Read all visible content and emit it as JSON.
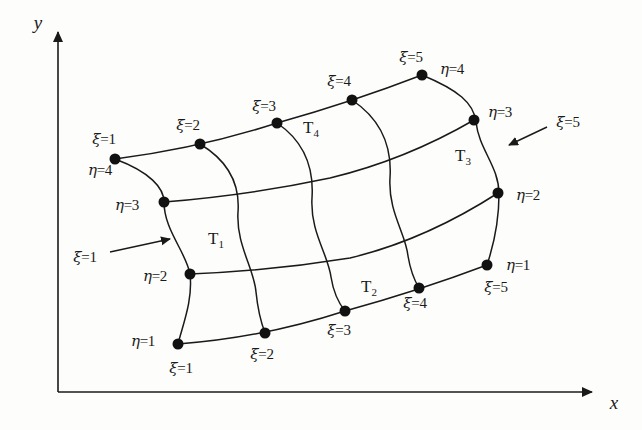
{
  "figure": {
    "background_color": "#fdfdfb",
    "line_color": "#1a1a1a",
    "node_color": "#111111"
  },
  "axes": {
    "x_label": "x",
    "y_label": "y",
    "origin": {
      "x": 58,
      "y": 392
    },
    "x_end": {
      "x": 600,
      "y": 392
    },
    "y_end": {
      "x": 58,
      "y": 25
    }
  },
  "elements": [
    {
      "name": "T",
      "index": "1",
      "x": 216,
      "y": 240
    },
    {
      "name": "T",
      "index": "2",
      "x": 369,
      "y": 288
    },
    {
      "name": "T",
      "index": "3",
      "x": 463,
      "y": 157
    },
    {
      "name": "T",
      "index": "4",
      "x": 311,
      "y": 129
    }
  ],
  "annotations": [
    {
      "text_sym": "ξ",
      "text_val": "=1",
      "label_x": 85,
      "label_y": 257,
      "arrow_from": {
        "x": 110,
        "y": 252
      },
      "arrow_to": {
        "x": 175,
        "y": 238
      }
    },
    {
      "text_sym": "ξ",
      "text_val": "=5",
      "label_x": 568,
      "label_y": 122,
      "arrow_from": {
        "x": 545,
        "y": 128
      },
      "arrow_to": {
        "x": 503,
        "y": 148
      }
    }
  ],
  "node_labels": [
    {
      "sym": "ξ",
      "val": "=1",
      "x": 104,
      "y": 139
    },
    {
      "sym": "ξ",
      "val": "=2",
      "x": 188,
      "y": 125
    },
    {
      "sym": "ξ",
      "val": "=3",
      "x": 264,
      "y": 106
    },
    {
      "sym": "ξ",
      "val": "=4",
      "x": 339,
      "y": 81
    },
    {
      "sym": "ξ",
      "val": "=5",
      "x": 411,
      "y": 57
    },
    {
      "sym": "η",
      "val": "=4",
      "x": 452,
      "y": 69
    },
    {
      "sym": "η",
      "val": "=3",
      "x": 500,
      "y": 112
    },
    {
      "sym": "η",
      "val": "=2",
      "x": 528,
      "y": 195
    },
    {
      "sym": "η",
      "val": "=1",
      "x": 518,
      "y": 265
    },
    {
      "sym": "ξ",
      "val": "=5",
      "x": 496,
      "y": 287
    },
    {
      "sym": "ξ",
      "val": "=4",
      "x": 415,
      "y": 303
    },
    {
      "sym": "ξ",
      "val": "=3",
      "x": 339,
      "y": 330
    },
    {
      "sym": "ξ",
      "val": "=2",
      "x": 262,
      "y": 354
    },
    {
      "sym": "ξ",
      "val": "=1",
      "x": 181,
      "y": 368
    },
    {
      "sym": "η",
      "val": "=1",
      "x": 143,
      "y": 341
    },
    {
      "sym": "η",
      "val": "=2",
      "x": 155,
      "y": 276
    },
    {
      "sym": "η",
      "val": "=3",
      "x": 127,
      "y": 205
    },
    {
      "sym": "η",
      "val": "=4",
      "x": 100,
      "y": 170
    }
  ],
  "mesh": {
    "xi_count": 5,
    "eta_count": 4,
    "nodes": [
      {
        "xi": 1,
        "eta": 4,
        "x": 115,
        "y": 159
      },
      {
        "xi": 2,
        "eta": 4,
        "x": 200,
        "y": 144
      },
      {
        "xi": 3,
        "eta": 4,
        "x": 277,
        "y": 123
      },
      {
        "xi": 4,
        "eta": 4,
        "x": 352,
        "y": 100
      },
      {
        "xi": 5,
        "eta": 4,
        "x": 422,
        "y": 75
      },
      {
        "xi": 1,
        "eta": 3,
        "x": 164,
        "y": 202
      },
      {
        "xi": 5,
        "eta": 3,
        "x": 474,
        "y": 120
      },
      {
        "xi": 1,
        "eta": 2,
        "x": 190,
        "y": 274
      },
      {
        "xi": 5,
        "eta": 2,
        "x": 498,
        "y": 193
      },
      {
        "xi": 1,
        "eta": 1,
        "x": 178,
        "y": 344
      },
      {
        "xi": 2,
        "eta": 1,
        "x": 265,
        "y": 333
      },
      {
        "xi": 3,
        "eta": 1,
        "x": 345,
        "y": 311
      },
      {
        "xi": 4,
        "eta": 1,
        "x": 419,
        "y": 288
      },
      {
        "xi": 5,
        "eta": 1,
        "x": 487,
        "y": 265
      }
    ],
    "eta_curves": [
      {
        "eta": 4,
        "path": "M 115 159 Q 200 148 277 123 Q 352 102 422 75"
      },
      {
        "eta": 3,
        "path": "M 164 202 Q 250 195 330 178 Q 405 160 474 120"
      },
      {
        "eta": 2,
        "path": "M 190 274 Q 270 271 350 258 Q 425 240 498 193"
      },
      {
        "eta": 1,
        "path": "M 178 344 Q 262 338 345 311 Q 418 291 487 265"
      }
    ],
    "xi_curves": [
      {
        "xi": 1,
        "path": "M 115 159 Q 168 185 164 202 Q 190 245 190 274 Q 185 315 178 344"
      },
      {
        "xi": 2,
        "path": "M 200 144 Q 238 185 236 215 Q 254 265 255 292 Q 261 315 265 333"
      },
      {
        "xi": 3,
        "path": "M 277 123 Q 312 168 311 200 Q 328 250 330 276 Q 339 298 345 311"
      },
      {
        "xi": 4,
        "path": "M 352 100 Q 390 148 390 180 Q 406 228 407 254 Q 414 275 419 288"
      },
      {
        "xi": 5,
        "path": "M 422 75 Q 468 98 474 120 Q 497 160 498 193 Q 494 233 487 265"
      }
    ]
  }
}
